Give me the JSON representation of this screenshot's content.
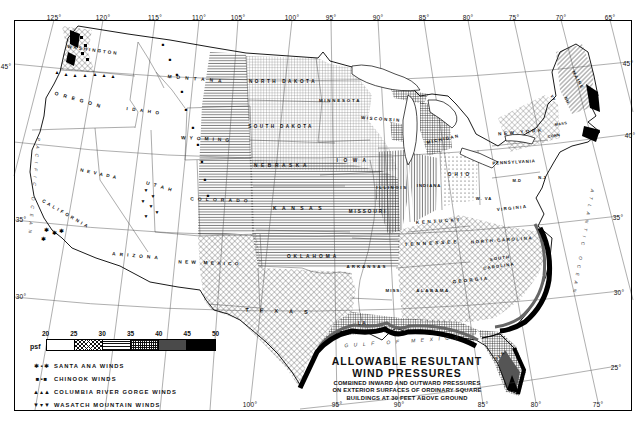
{
  "colors": {
    "ink": "#111111",
    "paper": "#ffffff"
  },
  "title": {
    "line1": "ALLOWABLE RESULTANT",
    "line2": "WIND PRESSURES",
    "sub1": "COMBINED INWARD AND OUTWARD PRESSURES",
    "sub2": "ON EXTERIOR SURFACES OF ORDINARY SQUARE",
    "sub3": "BUILDINGS AT 30 FEET ABOVE GROUND"
  },
  "legend": {
    "unit": "psf",
    "ticks": [
      "20",
      "25",
      "30",
      "35",
      "40",
      "45",
      "50"
    ],
    "swatches": [
      {
        "pattern": "none",
        "range_psf": "20-25"
      },
      {
        "pattern": "diamond",
        "range_psf": "25-30"
      },
      {
        "pattern": "hlines",
        "range_psf": "30-35"
      },
      {
        "pattern": "grid",
        "range_psf": "35-40"
      },
      {
        "pattern": "darkgray",
        "range_psf": "40-45"
      },
      {
        "pattern": "black",
        "range_psf": "45-50"
      }
    ],
    "winds": [
      {
        "glyphs": "✱▪✱",
        "label": "SANTA ANA WINDS"
      },
      {
        "glyphs": "■▪■",
        "label": "CHINOOK WINDS"
      },
      {
        "glyphs": "▲▴▲",
        "label": "COLUMBIA RIVER GORGE WINDS"
      },
      {
        "glyphs": "▼▾▼",
        "label": "WASATCH MOUNTAIN WINDS"
      }
    ]
  },
  "graticule": {
    "top": [
      {
        "t": "125°",
        "x": 54
      },
      {
        "t": "120°",
        "x": 103
      },
      {
        "t": "115°",
        "x": 155
      },
      {
        "t": "110°",
        "x": 199
      },
      {
        "t": "105°",
        "x": 238
      },
      {
        "t": "100°",
        "x": 292
      },
      {
        "t": "95°",
        "x": 331
      },
      {
        "t": "90°",
        "x": 378
      },
      {
        "t": "85°",
        "x": 424
      },
      {
        "t": "80°",
        "x": 468
      },
      {
        "t": "75°",
        "x": 514
      },
      {
        "t": "70°",
        "x": 561
      },
      {
        "t": "65°",
        "x": 610
      }
    ],
    "bottom": [
      {
        "t": "100°",
        "x": 250
      },
      {
        "t": "95°",
        "x": 337
      },
      {
        "t": "90°",
        "x": 399
      },
      {
        "t": "85°",
        "x": 483
      },
      {
        "t": "80°",
        "x": 536
      },
      {
        "t": "75°",
        "x": 598
      }
    ],
    "left": [
      {
        "t": "45°",
        "x": 6,
        "y": 66
      },
      {
        "t": "35°",
        "x": 21,
        "y": 219
      },
      {
        "t": "30°",
        "x": 21,
        "y": 296
      }
    ],
    "right": [
      {
        "t": "45°",
        "x": 628,
        "y": 63
      },
      {
        "t": "40°",
        "x": 630,
        "y": 135
      },
      {
        "t": "35°",
        "x": 618,
        "y": 217
      },
      {
        "t": "30°",
        "x": 619,
        "y": 292
      },
      {
        "t": "25°",
        "x": 616,
        "y": 367
      }
    ]
  },
  "states": [
    {
      "t": "WASHINGTON",
      "x": 93,
      "y": 50,
      "r": 8,
      "s": 4.6,
      "ls": 2
    },
    {
      "t": "OREGON",
      "x": 80,
      "y": 100,
      "r": 16,
      "s": 5,
      "ls": 5
    },
    {
      "t": "CALIFORNIA",
      "x": 66,
      "y": 214,
      "r": 30,
      "s": 4.6,
      "ls": 2.6
    },
    {
      "t": "NEVADA",
      "x": 100,
      "y": 174,
      "r": 12,
      "s": 4.6,
      "ls": 3.5
    },
    {
      "t": "IDAHO",
      "x": 145,
      "y": 111,
      "r": 8,
      "s": 4.6,
      "ls": 4.5
    },
    {
      "t": "MONTANA",
      "x": 197,
      "y": 79,
      "r": 5,
      "s": 4.8,
      "ls": 5
    },
    {
      "t": "WYOMING",
      "x": 207,
      "y": 139,
      "r": 3,
      "s": 4.8,
      "ls": 4
    },
    {
      "t": "UTAH",
      "x": 161,
      "y": 187,
      "r": 16,
      "s": 4.8,
      "ls": 4.5
    },
    {
      "t": "ARIZONA",
      "x": 137,
      "y": 256,
      "r": 5,
      "s": 4.8,
      "ls": 4
    },
    {
      "t": "COLORADO",
      "x": 221,
      "y": 200,
      "r": 2,
      "s": 4.8,
      "ls": 4.2
    },
    {
      "t": "NEW MEXICO",
      "x": 210,
      "y": 263,
      "r": 2,
      "s": 4.8,
      "ls": 3.2
    },
    {
      "t": "NORTH DAKOTA",
      "x": 283,
      "y": 81,
      "r": 0,
      "s": 4.6,
      "ls": 2.6
    },
    {
      "t": "SOUTH DAKOTA",
      "x": 281,
      "y": 126,
      "r": 0,
      "s": 4.6,
      "ls": 2.4
    },
    {
      "t": "NEBRASKA",
      "x": 282,
      "y": 165,
      "r": 0,
      "s": 4.8,
      "ls": 3.6
    },
    {
      "t": "KANSAS",
      "x": 300,
      "y": 208,
      "r": 0,
      "s": 5,
      "ls": 5.5
    },
    {
      "t": "OKLAHOMA",
      "x": 313,
      "y": 256,
      "r": 0,
      "s": 4.8,
      "ls": 3
    },
    {
      "t": "TEXAS",
      "x": 282,
      "y": 311,
      "r": 2,
      "s": 5.5,
      "ls": 11
    },
    {
      "t": "MINNESOTA",
      "x": 340,
      "y": 100,
      "r": 0,
      "s": 4.4,
      "ls": 1.8
    },
    {
      "t": "IOWA",
      "x": 354,
      "y": 160,
      "r": 0,
      "s": 4.8,
      "ls": 5.5
    },
    {
      "t": "WISCONSIN",
      "x": 381,
      "y": 119,
      "r": 4,
      "s": 4.4,
      "ls": 1.6
    },
    {
      "t": "ILLINOIS",
      "x": 392,
      "y": 187,
      "r": 0,
      "s": 4.4,
      "ls": 1.6
    },
    {
      "t": "INDIANA",
      "x": 429,
      "y": 185,
      "r": 0,
      "s": 4.2,
      "ls": 1
    },
    {
      "t": "MICHIGAN",
      "x": 443,
      "y": 139,
      "r": -12,
      "s": 4.4,
      "ls": 1.4
    },
    {
      "t": "OHIO",
      "x": 460,
      "y": 174,
      "r": 0,
      "s": 4.6,
      "ls": 3.2
    },
    {
      "t": "KENTUCKY",
      "x": 439,
      "y": 221,
      "r": -4,
      "s": 4.6,
      "ls": 2.6
    },
    {
      "t": "TENNESSEE",
      "x": 432,
      "y": 243,
      "r": -3,
      "s": 4.6,
      "ls": 3
    },
    {
      "t": "MISSOURI",
      "x": 368,
      "y": 211,
      "r": 0,
      "s": 4.6,
      "ls": 2
    },
    {
      "t": "ARKANSAS",
      "x": 367,
      "y": 266,
      "r": 0,
      "s": 4.4,
      "ls": 2
    },
    {
      "t": "LA.",
      "x": 364,
      "y": 323,
      "r": 0,
      "s": 4.6,
      "ls": 1.5
    },
    {
      "t": "MISS.",
      "x": 394,
      "y": 290,
      "r": 0,
      "s": 4.4,
      "ls": 1
    },
    {
      "t": "ALABAMA",
      "x": 433,
      "y": 290,
      "r": 0,
      "s": 4.4,
      "ls": 1.6
    },
    {
      "t": "GEORGIA",
      "x": 471,
      "y": 280,
      "r": -6,
      "s": 4.6,
      "ls": 2.2
    },
    {
      "t": "FLA.",
      "x": 501,
      "y": 355,
      "r": -40,
      "s": 4.4,
      "ls": 1
    },
    {
      "t": "NORTH CAROLINA",
      "x": 502,
      "y": 240,
      "r": -4,
      "s": 4.4,
      "ls": 1.6
    },
    {
      "t": "SOUTH",
      "x": 500,
      "y": 258,
      "r": -8,
      "s": 4.2,
      "ls": 1.2
    },
    {
      "t": "CAROLINA",
      "x": 499,
      "y": 266,
      "r": -8,
      "s": 4.2,
      "ls": 1.2
    },
    {
      "t": "VIRGINIA",
      "x": 512,
      "y": 208,
      "r": -6,
      "s": 4.4,
      "ls": 1.4
    },
    {
      "t": "W. VA",
      "x": 484,
      "y": 198,
      "r": 0,
      "s": 4.2,
      "ls": 1
    },
    {
      "t": "M.D",
      "x": 517,
      "y": 180,
      "r": 0,
      "s": 4,
      "ls": 0.5
    },
    {
      "t": "N.J",
      "x": 542,
      "y": 177,
      "r": 0,
      "s": 4,
      "ls": 0.5
    },
    {
      "t": "PENNSYLVANIA",
      "x": 514,
      "y": 162,
      "r": -3,
      "s": 4.4,
      "ls": 0.8
    },
    {
      "t": "NEW YORK",
      "x": 521,
      "y": 132,
      "r": -5,
      "s": 4.6,
      "ls": 2.6
    },
    {
      "t": "CONN",
      "x": 554,
      "y": 136,
      "r": -10,
      "s": 3.8,
      "ls": 0.4
    },
    {
      "t": "MASS",
      "x": 561,
      "y": 124,
      "r": -10,
      "s": 3.8,
      "ls": 0.4
    },
    {
      "t": "VT",
      "x": 553,
      "y": 98,
      "r": 65,
      "s": 4,
      "ls": 0.5
    },
    {
      "t": "NH",
      "x": 567,
      "y": 100,
      "r": 65,
      "s": 4,
      "ls": 0.5
    },
    {
      "t": "MAINE",
      "x": 578,
      "y": 80,
      "r": 62,
      "s": 4.4,
      "ls": 1.2
    }
  ],
  "waters": [
    {
      "t": "GULF OF MEXICO",
      "x": 404,
      "y": 341,
      "r": -4,
      "s": 5,
      "ls": 5.5
    },
    {
      "t": "ATLANTIC OCEAN",
      "x": 583,
      "y": 243,
      "r": 100,
      "s": 4.6,
      "ls": 5
    },
    {
      "t": "PACIFIC OCEAN",
      "x": 34,
      "y": 188,
      "r": 95,
      "s": 4.6,
      "ls": 5
    }
  ],
  "wind_marks": [
    {
      "name": "chinook",
      "glyph": "■",
      "size": 4.5,
      "pts": [
        [
          163,
          45
        ],
        [
          170,
          60
        ],
        [
          177,
          75
        ],
        [
          182,
          92
        ],
        [
          186,
          110
        ],
        [
          193,
          128
        ],
        [
          198,
          145
        ],
        [
          202,
          162
        ],
        [
          205,
          180
        ],
        [
          208,
          196
        ]
      ]
    },
    {
      "name": "columbia-river-gorge",
      "glyph": "▲",
      "size": 5,
      "pts": [
        [
          57,
          72
        ],
        [
          66,
          74
        ],
        [
          75,
          75
        ],
        [
          85,
          75
        ],
        [
          95,
          74
        ],
        [
          104,
          75
        ],
        [
          113,
          76
        ]
      ]
    },
    {
      "name": "wasatch-mountain",
      "glyph": "▼",
      "size": 5,
      "pts": [
        [
          146,
          190
        ],
        [
          153,
          196
        ],
        [
          143,
          201
        ],
        [
          151,
          206
        ],
        [
          157,
          212
        ],
        [
          146,
          216
        ]
      ]
    },
    {
      "name": "santa-ana",
      "glyph": "✱",
      "size": 5.5,
      "pts": [
        [
          46,
          231
        ],
        [
          54,
          234
        ],
        [
          61,
          232
        ],
        [
          43,
          240
        ]
      ]
    }
  ]
}
